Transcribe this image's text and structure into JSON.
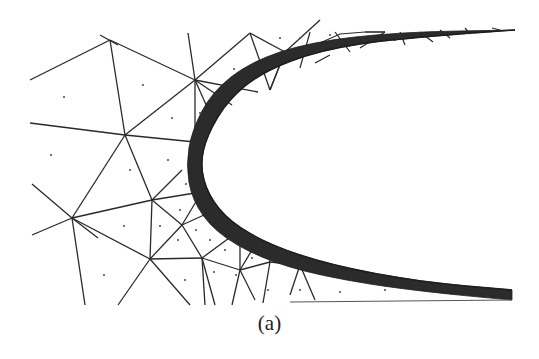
{
  "figure": {
    "caption": "(a)",
    "colors": {
      "background": "#ffffff",
      "mesh_line": "#2a2a2a",
      "boundary_layer": "#2b2b2b",
      "centroid_dot": "#555555"
    },
    "mesh": {
      "nodes": {
        "A": [
          110,
          40
        ],
        "B": [
          195,
          80
        ],
        "C": [
          125,
          135
        ],
        "D": [
          72,
          218
        ],
        "E": [
          152,
          200
        ],
        "F": [
          150,
          259
        ],
        "G": [
          182,
          225
        ],
        "H": [
          202,
          258
        ],
        "I": [
          250,
          33
        ],
        "J": [
          285,
          52
        ],
        "K": [
          240,
          280
        ],
        "L": [
          180,
          110
        ],
        "M": [
          220,
          200
        ],
        "N": [
          270,
          268
        ]
      },
      "edges": [
        [
          [
            30,
            80
          ],
          [
            110,
            40
          ]
        ],
        [
          [
            100,
            35
          ],
          [
            118,
            45
          ]
        ],
        [
          [
            110,
            40
          ],
          [
            195,
            80
          ]
        ],
        [
          [
            110,
            40
          ],
          [
            125,
            135
          ]
        ],
        [
          [
            30,
            123
          ],
          [
            125,
            135
          ]
        ],
        [
          [
            125,
            135
          ],
          [
            195,
            80
          ]
        ],
        [
          [
            125,
            135
          ],
          [
            195,
            142
          ]
        ],
        [
          [
            125,
            135
          ],
          [
            152,
            200
          ]
        ],
        [
          [
            125,
            135
          ],
          [
            72,
            218
          ]
        ],
        [
          [
            188,
            33
          ],
          [
            195,
            80
          ]
        ],
        [
          [
            195,
            80
          ],
          [
            250,
            33
          ]
        ],
        [
          [
            195,
            80
          ],
          [
            258,
            92
          ]
        ],
        [
          [
            195,
            80
          ],
          [
            232,
            105
          ]
        ],
        [
          [
            195,
            80
          ],
          [
            212,
            118
          ]
        ],
        [
          [
            195,
            80
          ],
          [
            195,
            142
          ]
        ],
        [
          [
            250,
            33
          ],
          [
            270,
            90
          ]
        ],
        [
          [
            250,
            33
          ],
          [
            285,
            52
          ]
        ],
        [
          [
            285,
            52
          ],
          [
            270,
            90
          ]
        ],
        [
          [
            285,
            52
          ],
          [
            320,
            20
          ]
        ],
        [
          [
            285,
            52
          ],
          [
            300,
            48
          ]
        ],
        [
          [
            32,
            184
          ],
          [
            72,
            218
          ]
        ],
        [
          [
            72,
            218
          ],
          [
            152,
            200
          ]
        ],
        [
          [
            72,
            218
          ],
          [
            32,
            235
          ]
        ],
        [
          [
            72,
            218
          ],
          [
            85,
            305
          ]
        ],
        [
          [
            72,
            218
          ],
          [
            98,
            238
          ]
        ],
        [
          [
            152,
            200
          ],
          [
            195,
            193
          ]
        ],
        [
          [
            152,
            200
          ],
          [
            182,
            225
          ]
        ],
        [
          [
            152,
            200
          ],
          [
            150,
            259
          ]
        ],
        [
          [
            152,
            200
          ],
          [
            182,
            170
          ]
        ],
        [
          [
            182,
            225
          ],
          [
            200,
            195
          ]
        ],
        [
          [
            182,
            225
          ],
          [
            215,
            210
          ]
        ],
        [
          [
            182,
            225
          ],
          [
            202,
            258
          ]
        ],
        [
          [
            182,
            225
          ],
          [
            150,
            259
          ]
        ],
        [
          [
            72,
            218
          ],
          [
            150,
            259
          ]
        ],
        [
          [
            150,
            259
          ],
          [
            202,
            258
          ]
        ],
        [
          [
            150,
            259
          ],
          [
            118,
            305
          ]
        ],
        [
          [
            150,
            259
          ],
          [
            190,
            305
          ]
        ],
        [
          [
            202,
            258
          ],
          [
            205,
            305
          ]
        ],
        [
          [
            202,
            258
          ],
          [
            215,
            305
          ]
        ],
        [
          [
            202,
            258
          ],
          [
            240,
            270
          ]
        ],
        [
          [
            202,
            258
          ],
          [
            240,
            230
          ]
        ],
        [
          [
            240,
            270
          ],
          [
            240,
            230
          ]
        ],
        [
          [
            240,
            270
          ],
          [
            258,
            240
          ]
        ],
        [
          [
            240,
            270
          ],
          [
            270,
            262
          ]
        ],
        [
          [
            240,
            270
          ],
          [
            232,
            305
          ]
        ],
        [
          [
            240,
            270
          ],
          [
            255,
            300
          ]
        ],
        [
          [
            270,
            262
          ],
          [
            268,
            248
          ]
        ],
        [
          [
            270,
            262
          ],
          [
            300,
            265
          ]
        ],
        [
          [
            270,
            262
          ],
          [
            263,
            303
          ]
        ],
        [
          [
            300,
            265
          ],
          [
            290,
            295
          ]
        ],
        [
          [
            300,
            265
          ],
          [
            315,
            300
          ]
        ]
      ]
    },
    "boundary_layer": {
      "inner_curve": [
        [
          515,
          30
        ],
        [
          400,
          38
        ],
        [
          320,
          50
        ],
        [
          262,
          72
        ],
        [
          228,
          100
        ],
        [
          207,
          135
        ],
        [
          200,
          165
        ],
        [
          208,
          195
        ],
        [
          230,
          222
        ],
        [
          270,
          245
        ],
        [
          330,
          265
        ],
        [
          420,
          282
        ],
        [
          512,
          290
        ]
      ],
      "outer_curve": [
        [
          515,
          30
        ],
        [
          400,
          32
        ],
        [
          310,
          42
        ],
        [
          250,
          62
        ],
        [
          212,
          92
        ],
        [
          192,
          130
        ],
        [
          186,
          165
        ],
        [
          192,
          200
        ],
        [
          215,
          232
        ],
        [
          260,
          258
        ],
        [
          320,
          276
        ],
        [
          420,
          292
        ],
        [
          512,
          300
        ]
      ]
    }
  }
}
